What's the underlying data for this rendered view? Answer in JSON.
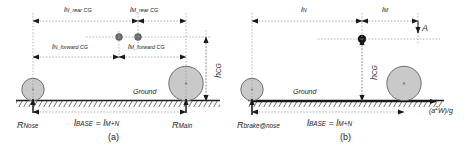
{
  "figure": {
    "type": "engineering-diagram",
    "ground_label": "Ground"
  },
  "panel_a": {
    "caption": "(a)",
    "dimensions": [
      {
        "id": "l_N_rear_CG",
        "base": "l",
        "sub": "N_rear CG"
      },
      {
        "id": "l_M_rear_CG",
        "base": "l",
        "sub": "M_rear CG"
      },
      {
        "id": "l_N_forward_CG",
        "base": "l",
        "sub": "N_forward CG"
      },
      {
        "id": "l_M_forward_CG",
        "base": "l",
        "sub": "M_forward CG"
      },
      {
        "id": "h_CG",
        "base": "h",
        "sub": "CG"
      }
    ],
    "reactions": [
      {
        "id": "R_Nose",
        "base": "R",
        "sub": "Nose"
      },
      {
        "id": "R_Main",
        "base": "R",
        "sub": "Main"
      }
    ],
    "wheelbase": {
      "base": "l",
      "sub": "BASE",
      "equals": "=",
      "rhs_base": "l",
      "rhs_sub": "M+N"
    },
    "ground": "Ground"
  },
  "panel_b": {
    "caption": "(b)",
    "dimensions": [
      {
        "id": "l_N",
        "base": "l",
        "sub": "N"
      },
      {
        "id": "l_M",
        "base": "l",
        "sub": "M"
      },
      {
        "id": "h_CG",
        "base": "h",
        "sub": "CG"
      }
    ],
    "point_label": "A",
    "reactions": [
      {
        "id": "R_brake_at_nose",
        "base": "R",
        "sub": "brake@nose"
      }
    ],
    "wheelbase": {
      "base": "l",
      "sub": "BASE",
      "equals": "=",
      "rhs_base": "l",
      "rhs_sub": "M+N"
    },
    "inertia_force": "(a",
    "inertia_force_sup": "2",
    "inertia_force_tail": "W)/g",
    "ground": "Ground"
  },
  "colors": {
    "line": "#1a1a1a",
    "dashed": "#8c8c8c",
    "wheel_fill": "#c9c9c9",
    "wheel_stroke": "#6e6e6e",
    "cg_dot_gray": "#6b6b6b",
    "cg_dot_black": "#111111",
    "background": "#ffffff"
  }
}
